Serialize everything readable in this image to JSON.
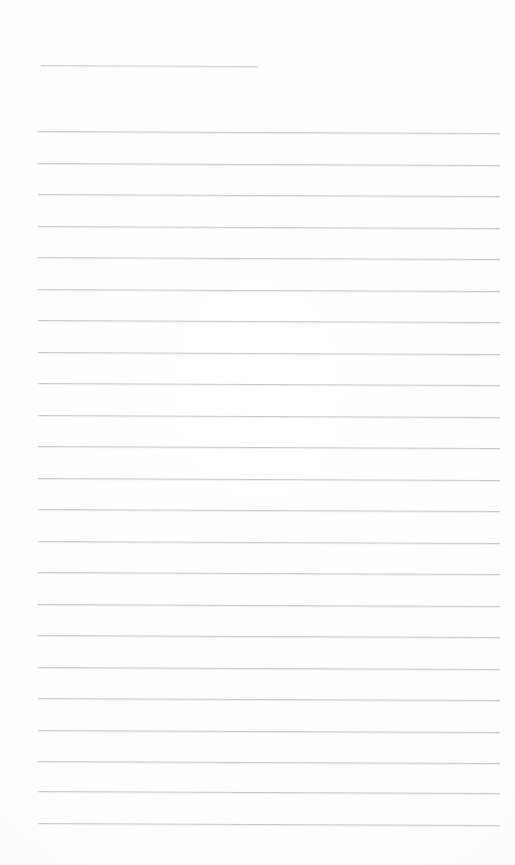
{
  "page": {
    "width": 515,
    "height": 865,
    "background_color": "#fefefe",
    "rule_color": "#c9c9ce",
    "content_text": "",
    "note": "Blank lined paper — no handwriting, typed text, or markings visible"
  },
  "layout": {
    "left_margin_px": 38,
    "right_edge_px": 500,
    "first_rule_y_px": 65,
    "line_spacing_px": 31.5,
    "slant_deg": 0.25
  },
  "rules": [
    {
      "name": "header-rule",
      "y": 65,
      "x_start": 41,
      "x_end": 258,
      "short": true
    },
    {
      "name": "body-rule-1",
      "y": 131,
      "x_start": 38,
      "x_end": 500,
      "short": false
    },
    {
      "name": "body-rule-2",
      "y": 163,
      "x_start": 38,
      "x_end": 500,
      "short": false
    },
    {
      "name": "body-rule-3",
      "y": 194,
      "x_start": 38,
      "x_end": 500,
      "short": false
    },
    {
      "name": "body-rule-4",
      "y": 226,
      "x_start": 38,
      "x_end": 500,
      "short": false
    },
    {
      "name": "body-rule-5",
      "y": 257,
      "x_start": 38,
      "x_end": 500,
      "short": false
    },
    {
      "name": "body-rule-6",
      "y": 289,
      "x_start": 38,
      "x_end": 500,
      "short": false
    },
    {
      "name": "body-rule-7",
      "y": 320,
      "x_start": 38,
      "x_end": 500,
      "short": false
    },
    {
      "name": "body-rule-8",
      "y": 352,
      "x_start": 38,
      "x_end": 500,
      "short": false
    },
    {
      "name": "body-rule-9",
      "y": 383,
      "x_start": 38,
      "x_end": 500,
      "short": false
    },
    {
      "name": "body-rule-10",
      "y": 415,
      "x_start": 38,
      "x_end": 500,
      "short": false
    },
    {
      "name": "body-rule-11",
      "y": 446,
      "x_start": 38,
      "x_end": 500,
      "short": false
    },
    {
      "name": "body-rule-12",
      "y": 478,
      "x_start": 38,
      "x_end": 500,
      "short": false
    },
    {
      "name": "body-rule-13",
      "y": 509,
      "x_start": 38,
      "x_end": 500,
      "short": false
    },
    {
      "name": "body-rule-14",
      "y": 541,
      "x_start": 38,
      "x_end": 500,
      "short": false
    },
    {
      "name": "body-rule-15",
      "y": 572,
      "x_start": 38,
      "x_end": 500,
      "short": false
    },
    {
      "name": "body-rule-16",
      "y": 604,
      "x_start": 38,
      "x_end": 500,
      "short": false
    },
    {
      "name": "body-rule-17",
      "y": 635,
      "x_start": 38,
      "x_end": 500,
      "short": false
    },
    {
      "name": "body-rule-18",
      "y": 667,
      "x_start": 38,
      "x_end": 500,
      "short": false
    },
    {
      "name": "body-rule-19",
      "y": 698,
      "x_start": 38,
      "x_end": 500,
      "short": false
    },
    {
      "name": "body-rule-20",
      "y": 730,
      "x_start": 38,
      "x_end": 500,
      "short": false
    },
    {
      "name": "body-rule-21",
      "y": 761,
      "x_start": 38,
      "x_end": 500,
      "short": false
    },
    {
      "name": "body-rule-22",
      "y": 791,
      "x_start": 38,
      "x_end": 500,
      "short": false
    },
    {
      "name": "body-rule-23",
      "y": 823,
      "x_start": 38,
      "x_end": 500,
      "short": false
    }
  ]
}
